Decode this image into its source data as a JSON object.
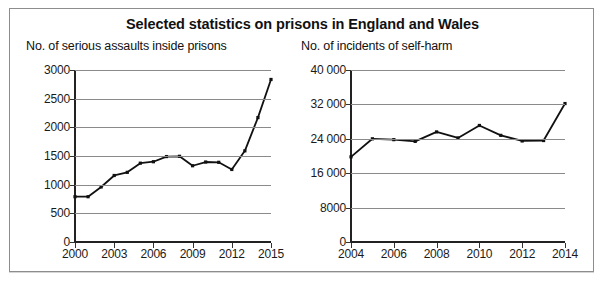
{
  "top_caption": "",
  "figure": {
    "title": "Selected statistics on prisons in England and Wales"
  },
  "chart_data": [
    {
      "type": "line",
      "panel": "left",
      "title": "No. of serious assaults inside prisons",
      "xlabel": "",
      "ylabel": "",
      "grid": true,
      "legend": "none",
      "xlim": [
        2000,
        2015
      ],
      "ylim": [
        0,
        3000
      ],
      "yticks": [
        0,
        500,
        1000,
        1500,
        2000,
        2500,
        3000
      ],
      "ytick_labels": [
        "0",
        "500",
        "1000",
        "1500",
        "2000",
        "2500",
        "3000"
      ],
      "xticks": [
        2000,
        2003,
        2006,
        2009,
        2012,
        2015
      ],
      "xtick_labels": [
        "2000",
        "2003",
        "2006",
        "2009",
        "2012",
        "2015"
      ],
      "x": [
        2000,
        2001,
        2002,
        2003,
        2004,
        2005,
        2006,
        2007,
        2008,
        2009,
        2010,
        2011,
        2012,
        2013,
        2014,
        2015
      ],
      "values": [
        790,
        790,
        960,
        1160,
        1215,
        1375,
        1400,
        1490,
        1495,
        1330,
        1395,
        1390,
        1265,
        1590,
        2170,
        2835
      ],
      "marker": "square",
      "color": "#111111"
    },
    {
      "type": "line",
      "panel": "right",
      "title": "No. of incidents of self-harm",
      "xlabel": "",
      "ylabel": "",
      "grid": true,
      "legend": "none",
      "xlim": [
        2004,
        2014
      ],
      "ylim": [
        0,
        40000
      ],
      "yticks": [
        0,
        8000,
        16000,
        24000,
        32000,
        40000
      ],
      "ytick_labels": [
        "0",
        "8000",
        "16 000",
        "24 000",
        "32 000",
        "40 000"
      ],
      "xticks": [
        2004,
        2006,
        2008,
        2010,
        2012,
        2014
      ],
      "xtick_labels": [
        "2004",
        "2006",
        "2008",
        "2010",
        "2012",
        "2014"
      ],
      "x": [
        2004,
        2005,
        2006,
        2007,
        2008,
        2009,
        2010,
        2011,
        2012,
        2013,
        2014
      ],
      "values": [
        19800,
        24000,
        23800,
        23400,
        25600,
        24200,
        27100,
        24800,
        23500,
        23600,
        32200
      ],
      "marker": "square",
      "color": "#111111"
    }
  ]
}
